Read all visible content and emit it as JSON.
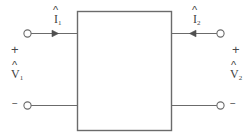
{
  "diagram": {
    "type": "two-port-network",
    "colors": {
      "line": "#6b6b6b",
      "box_stroke": "#6b6b6b",
      "text": "#3f3f3f",
      "background": "#ffffff"
    },
    "box": {
      "label": "",
      "x": 77,
      "y": 11,
      "width": 95,
      "height": 120
    },
    "ports": [
      {
        "id": "port-1",
        "side": "left",
        "current": {
          "symbol": "I",
          "subscript": "1",
          "accent": "hat",
          "direction": "into-network"
        },
        "voltage": {
          "symbol": "V",
          "subscript": "1",
          "accent": "hat"
        },
        "polarity_top": "+",
        "polarity_bottom": "−"
      },
      {
        "id": "port-2",
        "side": "right",
        "current": {
          "symbol": "I",
          "subscript": "2",
          "accent": "hat",
          "direction": "into-network"
        },
        "voltage": {
          "symbol": "V",
          "subscript": "2",
          "accent": "hat"
        },
        "polarity_top": "+",
        "polarity_bottom": "−"
      }
    ],
    "labels": {
      "i1_base": "I",
      "i1_sub": "1",
      "i2_base": "I",
      "i2_sub": "2",
      "v1_base": "V",
      "v1_sub": "1",
      "v2_base": "V",
      "v2_sub": "2",
      "hat": "^",
      "plus": "+",
      "minus": "−"
    }
  }
}
